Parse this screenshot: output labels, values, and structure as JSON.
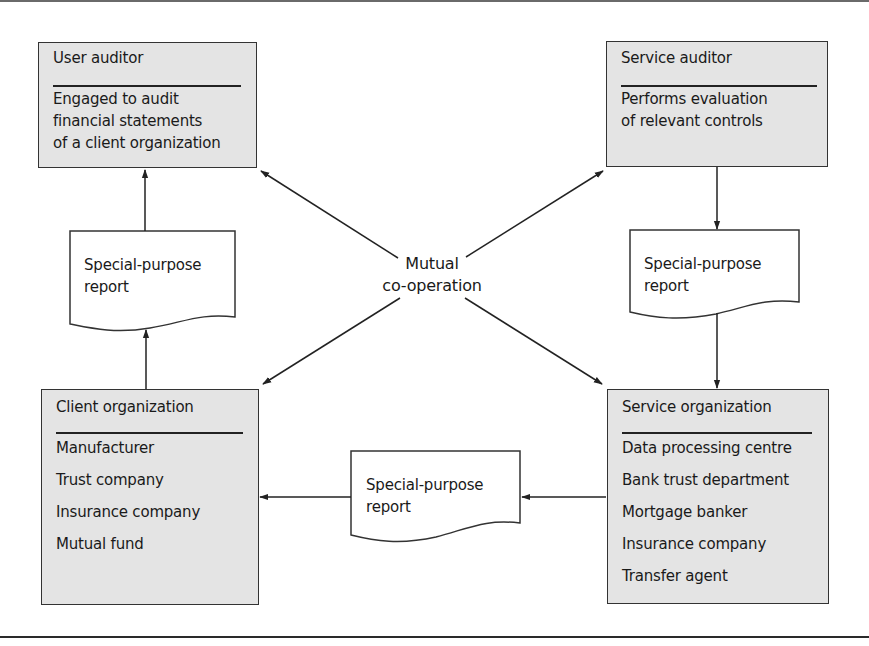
{
  "nodes": {
    "user_auditor": {
      "title": "User auditor",
      "lines": [
        "Engaged to audit",
        "financial statements",
        "of a client organization"
      ]
    },
    "service_auditor": {
      "title": "Service auditor",
      "lines": [
        "Performs evaluation",
        "of relevant controls"
      ]
    },
    "client_organization": {
      "title": "Client organization",
      "lines": [
        "Manufacturer",
        "Trust company",
        "Insurance company",
        "Mutual fund"
      ]
    },
    "service_organization": {
      "title": "Service organization",
      "lines": [
        "Data processing centre",
        "Bank trust department",
        "Mortgage banker",
        "Insurance company",
        "Transfer agent"
      ]
    }
  },
  "reports": {
    "left": {
      "line1": "Special-purpose",
      "line2": "report"
    },
    "right": {
      "line1": "Special-purpose",
      "line2": "report"
    },
    "bottom": {
      "line1": "Special-purpose",
      "line2": "report"
    }
  },
  "center": {
    "line1": "Mutual",
    "line2": "co-operation"
  },
  "colors": {
    "box_fill": "#e4e4e4",
    "stroke": "#222222",
    "doc_fill": "#ffffff"
  }
}
